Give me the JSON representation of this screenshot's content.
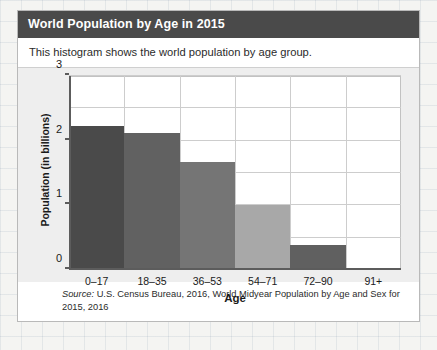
{
  "card": {
    "title": "World Population by Age in 2015",
    "subtitle": "This histogram shows the world population by age group.",
    "source_prefix": "Source:",
    "source_text": " U.S. Census Bureau, 2016, World Midyear Population by Age and Sex for 2015, 2016"
  },
  "colors": {
    "header_bg": "#4a4a4a",
    "header_text": "#ffffff",
    "chart_bg": "#eeeeee",
    "plot_bg": "#ffffff",
    "grid": "#cdcdcd",
    "axis": "#5c5c5c",
    "page_bg": "#f4f4f2"
  },
  "chart_data": {
    "type": "bar",
    "title": "World Population by Age in 2015",
    "subtitle": "This histogram shows the world population by age group.",
    "xlabel": "Age",
    "ylabel": "Population (in billions)",
    "categories": [
      "0–17",
      "18–35",
      "36–53",
      "54–71",
      "72–90",
      "91+"
    ],
    "values": [
      2.22,
      2.12,
      1.67,
      1.0,
      0.38,
      0.0
    ],
    "bar_colors": [
      "#4a4a4a",
      "#616161",
      "#757575",
      "#a8a8a8",
      "#606060",
      "#ffffff"
    ],
    "ylim": [
      0,
      3
    ],
    "y_ticks": [
      0,
      1,
      2,
      3
    ],
    "y_tick_labels": [
      "0",
      "1",
      "2",
      "3"
    ],
    "y_gridlines": [
      0.5,
      1.0,
      1.5,
      2.0,
      2.5,
      3.0
    ],
    "grid": true,
    "legend": false,
    "source": "Source: U.S. Census Bureau, 2016, World Midyear Population by Age and Sex for 2015, 2016"
  }
}
